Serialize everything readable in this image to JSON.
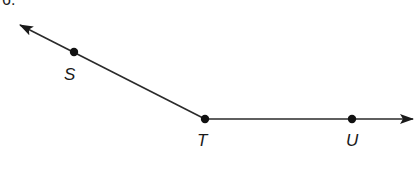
{
  "header": {
    "cutoff_text": "6."
  },
  "diagram": {
    "type": "angle",
    "line_color": "#2a2a2a",
    "point_color": "#111111",
    "points": [
      {
        "id": "S",
        "label": "S",
        "x": 74,
        "y": 52,
        "label_x": 70,
        "label_y": 78
      },
      {
        "id": "T",
        "label": "T",
        "x": 205,
        "y": 119,
        "label_x": 203,
        "label_y": 145
      },
      {
        "id": "U",
        "label": "U",
        "x": 352,
        "y": 119,
        "label_x": 353,
        "label_y": 145
      }
    ],
    "rays": [
      {
        "id": "ray-TS",
        "from": "T",
        "through": "S",
        "arrow_tip": {
          "x": 20,
          "y": 25
        }
      },
      {
        "id": "ray-TU",
        "from": "T",
        "through": "U",
        "arrow_tip": {
          "x": 413,
          "y": 119
        }
      }
    ]
  }
}
